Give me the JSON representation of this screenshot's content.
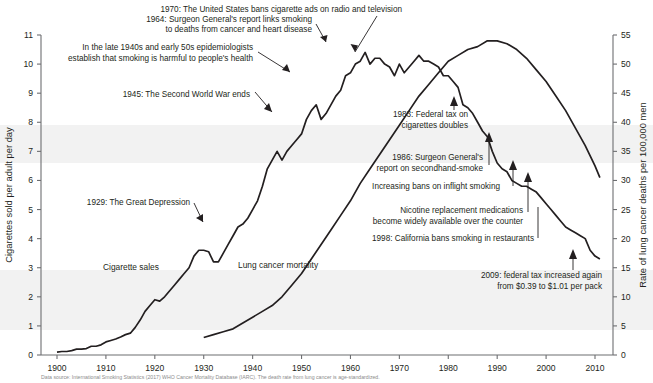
{
  "axes": {
    "left_title": "Cigarettes sold per adult per day",
    "right_title": "Rate of lung cancer deaths per 100,000 men",
    "left_ticks": [
      "0",
      "1",
      "2",
      "3",
      "4",
      "5",
      "6",
      "7",
      "8",
      "9",
      "10",
      "11"
    ],
    "right_ticks": [
      "0",
      "5",
      "10",
      "15",
      "20",
      "25",
      "30",
      "35",
      "40",
      "45",
      "50",
      "55"
    ],
    "x_ticks": [
      "1900",
      "1910",
      "1920",
      "1930",
      "1940",
      "1950",
      "1960",
      "1970",
      "1980",
      "1990",
      "2000",
      "2010"
    ]
  },
  "series_labels": {
    "cigarettes": "Cigarette sales",
    "lung_cancer": "Lung cancer mortality"
  },
  "annotations": {
    "a1970_l1": "1970: The United States bans cigarette ads on radio and television",
    "a1964_l1": "1964: Surgeon General's report links smoking",
    "a1964_l2": "to deaths from cancer and heart disease",
    "a1940s_l1": "In the late 1940s and early 50s epidemiologists",
    "a1940s_l2": "establish that smoking is harmful to people's health",
    "a1945": "1945: The Second World War ends",
    "a1929": "1929: The Great Depression",
    "a1983_l1": "1983: Federal tax on",
    "a1983_l2": "cigarettes doubles",
    "a1986_l1": "1986: Surgeon General's",
    "a1986_l2": "report on secondhand-smoke",
    "a_inflight": "Increasing bans on inflight smoking",
    "a_nicotine_l1": "Nicotine replacement medications",
    "a_nicotine_l2": "become widely available over the counter",
    "a1998": "1998: California bans smoking in restaurants",
    "a2009_l1": "2009: federal tax increased again",
    "a2009_l2": "from $0.39 to $1.01 per pack"
  },
  "caption": "Data source: International Smoking Statistics (2017) WHO Cancer Mortality Database (IARC). The death rate from lung cancer is age-standardized.",
  "colors": {
    "line": "#231f20",
    "text": "#231f20",
    "band": "#f2f2f2"
  },
  "chart_data": {
    "type": "line",
    "title": "",
    "xlabel": "",
    "ylabel": "Cigarettes sold per adult per day",
    "y2label": "Rate of lung cancer deaths per 100,000 men",
    "xlim": [
      1897,
      2014
    ],
    "ylim": [
      0,
      11
    ],
    "y2lim": [
      0,
      55
    ],
    "grid": false,
    "legend": "inline-labels",
    "series": [
      {
        "name": "Cigarette sales",
        "axis": "left",
        "units": "cigarettes sold per adult per day",
        "x": [
          1900,
          1901,
          1902,
          1903,
          1904,
          1905,
          1906,
          1907,
          1908,
          1909,
          1910,
          1911,
          1912,
          1913,
          1914,
          1915,
          1916,
          1917,
          1918,
          1919,
          1920,
          1921,
          1922,
          1923,
          1924,
          1925,
          1926,
          1927,
          1928,
          1929,
          1930,
          1931,
          1932,
          1933,
          1934,
          1935,
          1936,
          1937,
          1938,
          1939,
          1940,
          1941,
          1942,
          1943,
          1944,
          1945,
          1946,
          1947,
          1948,
          1949,
          1950,
          1951,
          1952,
          1953,
          1954,
          1955,
          1956,
          1957,
          1958,
          1959,
          1960,
          1961,
          1962,
          1963,
          1964,
          1965,
          1966,
          1967,
          1968,
          1969,
          1970,
          1971,
          1972,
          1973,
          1974,
          1975,
          1976,
          1977,
          1978,
          1979,
          1980,
          1981,
          1982,
          1983,
          1984,
          1985,
          1986,
          1987,
          1988,
          1989,
          1990,
          1991,
          1992,
          1993,
          1994,
          1995,
          1996,
          1997,
          1998,
          1999,
          2000,
          2001,
          2002,
          2003,
          2004,
          2005,
          2006,
          2007,
          2008,
          2009,
          2010,
          2011
        ],
        "y": [
          0.1,
          0.12,
          0.12,
          0.15,
          0.2,
          0.2,
          0.22,
          0.3,
          0.3,
          0.35,
          0.45,
          0.5,
          0.55,
          0.62,
          0.7,
          0.75,
          0.95,
          1.2,
          1.5,
          1.7,
          1.9,
          1.85,
          2.0,
          2.2,
          2.4,
          2.6,
          2.8,
          3.0,
          3.4,
          3.6,
          3.6,
          3.55,
          3.2,
          3.2,
          3.5,
          3.8,
          4.1,
          4.4,
          4.5,
          4.7,
          5.0,
          5.3,
          5.8,
          6.4,
          6.7,
          7.0,
          6.7,
          7.0,
          7.2,
          7.4,
          7.6,
          8.1,
          8.4,
          8.6,
          8.1,
          8.3,
          8.6,
          8.9,
          9.1,
          9.6,
          9.7,
          10.0,
          10.1,
          10.4,
          10.0,
          10.2,
          10.2,
          10.0,
          9.9,
          9.6,
          10.0,
          9.7,
          9.9,
          10.1,
          10.3,
          10.1,
          10.1,
          10.0,
          9.9,
          9.6,
          9.6,
          9.4,
          9.2,
          8.6,
          8.5,
          8.3,
          8.0,
          7.7,
          7.5,
          7.0,
          6.6,
          6.4,
          6.3,
          6.0,
          5.9,
          5.8,
          5.8,
          5.7,
          5.6,
          5.4,
          5.2,
          5.0,
          4.8,
          4.6,
          4.4,
          4.3,
          4.2,
          4.1,
          4.0,
          3.6,
          3.4,
          3.3
        ]
      },
      {
        "name": "Lung cancer mortality",
        "axis": "right",
        "units": "deaths per 100,000 men (age-standardized)",
        "x": [
          1930,
          1932,
          1934,
          1936,
          1938,
          1940,
          1942,
          1944,
          1946,
          1948,
          1950,
          1952,
          1954,
          1956,
          1958,
          1960,
          1962,
          1964,
          1966,
          1968,
          1970,
          1972,
          1974,
          1976,
          1978,
          1980,
          1982,
          1984,
          1986,
          1988,
          1990,
          1992,
          1994,
          1996,
          1998,
          2000,
          2002,
          2004,
          2006,
          2008,
          2010,
          2011
        ],
        "y": [
          3,
          3.5,
          4,
          4.5,
          5.5,
          6.5,
          7.5,
          8.5,
          10,
          12,
          14,
          16.5,
          19,
          21.5,
          24,
          26.5,
          29.5,
          32,
          34.5,
          37,
          39.5,
          42,
          44.5,
          46.5,
          48.5,
          50.5,
          51.5,
          52.5,
          53,
          54,
          54,
          53.5,
          52.5,
          51,
          49,
          47,
          44.5,
          42,
          39,
          36,
          32.5,
          30.5
        ]
      }
    ],
    "annotated_events": [
      {
        "year": 1929,
        "label": "1929: The Great Depression"
      },
      {
        "year": 1945,
        "label": "1945: The Second World War ends"
      },
      {
        "year": 1950,
        "label": "In the late 1940s and early 50s epidemiologists establish that smoking is harmful to people's health"
      },
      {
        "year": 1964,
        "label": "1964: Surgeon General's report links smoking to deaths from cancer and heart disease"
      },
      {
        "year": 1970,
        "label": "1970: The United States bans cigarette ads on radio and television"
      },
      {
        "year": 1983,
        "label": "1983: Federal tax on cigarettes doubles"
      },
      {
        "year": 1986,
        "label": "1986: Surgeon General's report on secondhand-smoke"
      },
      {
        "year": 1990,
        "label": "Increasing bans on inflight smoking"
      },
      {
        "year": 1996,
        "label": "Nicotine replacement medications become widely available over the counter"
      },
      {
        "year": 1998,
        "label": "1998: California bans smoking in restaurants"
      },
      {
        "year": 2009,
        "label": "2009: federal tax increased again from $0.39 to $1.01 per pack"
      }
    ]
  }
}
